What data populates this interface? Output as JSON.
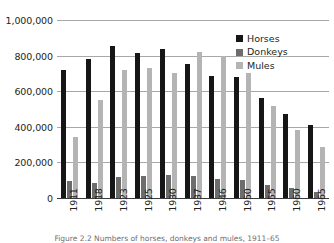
{
  "chart_data": {
    "type": "bar",
    "title": "",
    "subtitle": "",
    "xlabel": "",
    "ylabel": "",
    "ylim": [
      0,
      1000000
    ],
    "ytick_labels": [
      "1,000,000",
      "800,000",
      "600,000",
      "400,000",
      "200,000",
      "0"
    ],
    "ytick_values": [
      1000000,
      800000,
      600000,
      400000,
      200000,
      0
    ],
    "grid": "horizontal",
    "legend_position": "top-right",
    "categories": [
      "1911",
      "1918",
      "1923",
      "1925",
      "1930",
      "1937",
      "1946",
      "1950",
      "1955",
      "1960",
      "1965"
    ],
    "series": [
      {
        "name": "Horses",
        "color": "#161616",
        "values": [
          720000,
          780000,
          855000,
          815000,
          835000,
          755000,
          685000,
          680000,
          560000,
          470000,
          410000
        ]
      },
      {
        "name": "Donkeys",
        "color": "#6d6d6d",
        "values": [
          95000,
          85000,
          120000,
          125000,
          132000,
          126000,
          105000,
          100000,
          75000,
          58000,
          35000
        ]
      },
      {
        "name": "Mules",
        "color": "#b4b4b4",
        "values": [
          340000,
          552000,
          720000,
          730000,
          700000,
          820000,
          800000,
          700000,
          518000,
          380000,
          288000
        ]
      }
    ]
  },
  "caption": {
    "text": "Figure 2.2  Numbers of horses, donkeys and mules, 1911–65"
  }
}
